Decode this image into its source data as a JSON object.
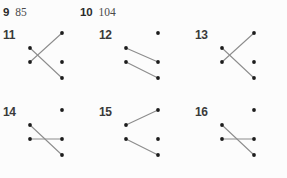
{
  "page": {
    "background_color": "#fcfcfc",
    "dot_color": "#1c1c1c",
    "line_color": "#8c8c8c",
    "label_color": "#3a3a3a"
  },
  "answer_row": {
    "entries": [
      {
        "number": "9",
        "value": "85",
        "x": 3,
        "y": 2
      },
      {
        "number": "10",
        "value": "104",
        "x": 80,
        "y": 2
      }
    ]
  },
  "puzzle_grid": {
    "columns": 3,
    "rows": 2,
    "cell_width": 96,
    "cell_height": 77,
    "dot_radius": 1.9,
    "left_column_x": 30,
    "right_column_x": 62,
    "row_y": [
      9,
      24,
      38,
      54
    ],
    "cells": [
      {
        "number": "11",
        "x": 0,
        "y": 0,
        "dots": [
          {
            "col": "left",
            "row": 1
          },
          {
            "col": "left",
            "row": 2
          },
          {
            "col": "right",
            "row": 0
          },
          {
            "col": "right",
            "row": 2
          },
          {
            "col": "right",
            "row": 3
          }
        ],
        "lines": [
          {
            "from": {
              "col": "left",
              "row": 1
            },
            "to": {
              "col": "right",
              "row": 3
            }
          },
          {
            "from": {
              "col": "left",
              "row": 2
            },
            "to": {
              "col": "right",
              "row": 0
            }
          }
        ],
        "crossing": true
      },
      {
        "number": "12",
        "x": 96,
        "y": 0,
        "dots": [
          {
            "col": "left",
            "row": 1
          },
          {
            "col": "left",
            "row": 2
          },
          {
            "col": "right",
            "row": 0
          },
          {
            "col": "right",
            "row": 2
          },
          {
            "col": "right",
            "row": 3
          }
        ],
        "lines": [
          {
            "from": {
              "col": "left",
              "row": 1
            },
            "to": {
              "col": "right",
              "row": 2
            }
          },
          {
            "from": {
              "col": "left",
              "row": 2
            },
            "to": {
              "col": "right",
              "row": 3
            }
          }
        ],
        "crossing": false
      },
      {
        "number": "13",
        "x": 192,
        "y": 0,
        "dots": [
          {
            "col": "left",
            "row": 1
          },
          {
            "col": "left",
            "row": 2
          },
          {
            "col": "right",
            "row": 0
          },
          {
            "col": "right",
            "row": 2
          },
          {
            "col": "right",
            "row": 3
          }
        ],
        "lines": [
          {
            "from": {
              "col": "left",
              "row": 1
            },
            "to": {
              "col": "right",
              "row": 3
            }
          },
          {
            "from": {
              "col": "left",
              "row": 2
            },
            "to": {
              "col": "right",
              "row": 0
            }
          }
        ],
        "crossing": true
      },
      {
        "number": "14",
        "x": 0,
        "y": 77,
        "dots": [
          {
            "col": "left",
            "row": 1
          },
          {
            "col": "left",
            "row": 2
          },
          {
            "col": "right",
            "row": 0
          },
          {
            "col": "right",
            "row": 2
          },
          {
            "col": "right",
            "row": 3
          }
        ],
        "lines": [
          {
            "from": {
              "col": "left",
              "row": 1
            },
            "to": {
              "col": "right",
              "row": 3
            }
          },
          {
            "from": {
              "col": "left",
              "row": 2
            },
            "to": {
              "col": "right",
              "row": 2
            }
          }
        ],
        "crossing": true
      },
      {
        "number": "15",
        "x": 96,
        "y": 77,
        "dots": [
          {
            "col": "left",
            "row": 1
          },
          {
            "col": "left",
            "row": 2
          },
          {
            "col": "right",
            "row": 0
          },
          {
            "col": "right",
            "row": 2
          },
          {
            "col": "right",
            "row": 3
          }
        ],
        "lines": [
          {
            "from": {
              "col": "left",
              "row": 1
            },
            "to": {
              "col": "right",
              "row": 0
            }
          },
          {
            "from": {
              "col": "left",
              "row": 2
            },
            "to": {
              "col": "right",
              "row": 3
            }
          }
        ],
        "crossing": false
      },
      {
        "number": "16",
        "x": 192,
        "y": 77,
        "dots": [
          {
            "col": "left",
            "row": 1
          },
          {
            "col": "left",
            "row": 2
          },
          {
            "col": "right",
            "row": 0
          },
          {
            "col": "right",
            "row": 2
          },
          {
            "col": "right",
            "row": 3
          }
        ],
        "lines": [
          {
            "from": {
              "col": "left",
              "row": 1
            },
            "to": {
              "col": "right",
              "row": 3
            }
          },
          {
            "from": {
              "col": "left",
              "row": 2
            },
            "to": {
              "col": "right",
              "row": 2
            }
          }
        ],
        "crossing": true
      }
    ]
  }
}
